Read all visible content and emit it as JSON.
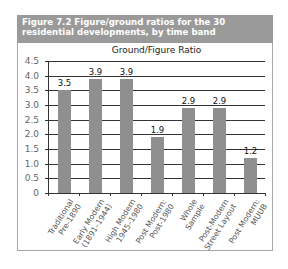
{
  "figure": {
    "title_line1": "Figure 7.2  Figure/ground ratios for the 30",
    "title_line2": "residential developments, by time band"
  },
  "chart_data": {
    "type": "bar",
    "title": "Ground/Figure Ratio",
    "categories": [
      "Traditional\nPre-1890",
      "Early Modern\n(1891–1944)",
      "High Modern\n1945–1980",
      "Post Modern:\nPost-1980",
      "Whole\nSample",
      "Post-Modern\nStreet Layout",
      "Post Modern:\nMUUB"
    ],
    "values": [
      3.5,
      3.9,
      3.9,
      1.9,
      2.9,
      2.9,
      1.2
    ],
    "value_labels": [
      "3.5",
      "3.9",
      "3.9",
      "1.9",
      "2.9",
      "2.9",
      "1.2"
    ],
    "xlabel": "",
    "ylabel": "",
    "ylim": [
      0,
      4.5
    ],
    "yticks": [
      "4.5",
      "4.0",
      "3.5",
      "3.0",
      "2.5",
      "2.0",
      "1.5",
      "1.0",
      "0.5",
      "0"
    ],
    "grid": true,
    "legend": "none",
    "bar_color": "#8f8f8f",
    "header_color": "#9a9a9a"
  }
}
